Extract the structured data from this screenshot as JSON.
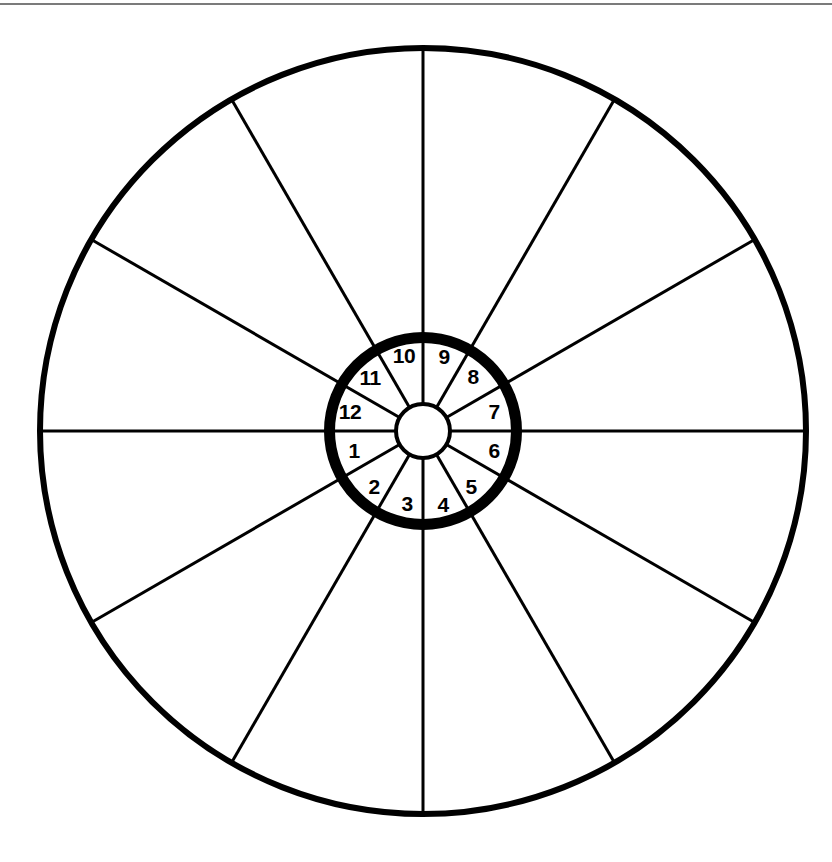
{
  "figure": {
    "kind": "wheel-diagram",
    "background_color": "#ffffff",
    "ink_color": "#000000"
  },
  "top_rule": {
    "color": "#7b7b7b",
    "y": 3,
    "thickness": 2
  },
  "geometry": {
    "center_x": 423,
    "center_y": 431,
    "outer_radius": 383,
    "outer_stroke": 6,
    "ring_outer_radius": 99,
    "ring_stroke": 11,
    "ring_inner_radius": 93,
    "hub_radius": 27,
    "hub_stroke": 4,
    "spoke_stroke": 3,
    "inner_divider_stroke": 3,
    "sector_count": 12,
    "sector_span_degrees": 30,
    "spoke_angles_degrees": [
      0,
      30,
      60,
      90,
      120,
      150,
      180,
      210,
      240,
      270,
      300,
      330
    ]
  },
  "sectors": [
    {
      "label": "1",
      "angle_deg": 195,
      "label_x": 354,
      "label_y": 450
    },
    {
      "label": "2",
      "angle_deg": 225,
      "label_x": 374,
      "label_y": 486
    },
    {
      "label": "3",
      "angle_deg": 255,
      "label_x": 407,
      "label_y": 503
    },
    {
      "label": "4",
      "angle_deg": 285,
      "label_x": 443,
      "label_y": 504
    },
    {
      "label": "5",
      "angle_deg": 315,
      "label_x": 471,
      "label_y": 486
    },
    {
      "label": "6",
      "angle_deg": 345,
      "label_x": 494,
      "label_y": 450
    },
    {
      "label": "7",
      "angle_deg": 15,
      "label_x": 494,
      "label_y": 411
    },
    {
      "label": "8",
      "angle_deg": 45,
      "label_x": 473,
      "label_y": 376
    },
    {
      "label": "9",
      "angle_deg": 75,
      "label_x": 444,
      "label_y": 356
    },
    {
      "label": "10",
      "angle_deg": 105,
      "label_x": 404,
      "label_y": 355
    },
    {
      "label": "11",
      "angle_deg": 135,
      "label_x": 370,
      "label_y": 377
    },
    {
      "label": "12",
      "angle_deg": 165,
      "label_x": 350,
      "label_y": 411
    }
  ]
}
